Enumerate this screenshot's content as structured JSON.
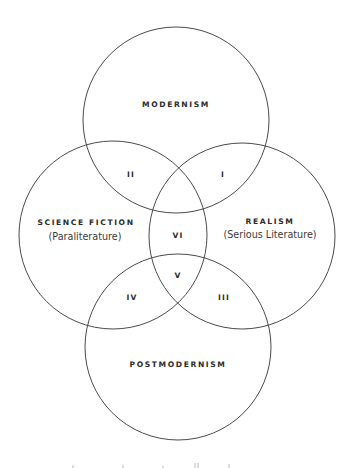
{
  "diagram": {
    "type": "venn",
    "line_color": "#4a4a4a",
    "text_color": "#2b2b2b",
    "sets": {
      "top": {
        "label": "MODERNISM",
        "sub": ""
      },
      "left": {
        "label": "SCIENCE FICTION",
        "sub": "(Paraliterature)"
      },
      "right": {
        "label": "REALISM",
        "sub": "(Serious Literature)"
      },
      "bottom": {
        "label": "POSTMODERNISM",
        "sub": ""
      }
    },
    "regions": {
      "modernism_realism": "I",
      "modernism_scifi": "II",
      "realism_postmodernism": "III",
      "scifi_postmodernism": "IV",
      "scifi_realism_postmodernism": "V",
      "scifi_realism_center": "VI"
    },
    "caption": ""
  }
}
